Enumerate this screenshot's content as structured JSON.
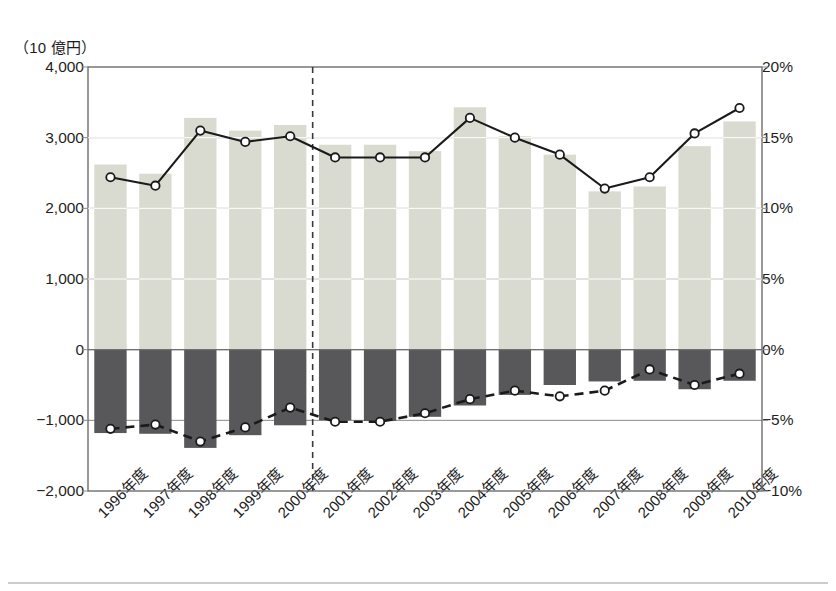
{
  "chart_data": {
    "type": "bar",
    "title": "",
    "subtitle": "",
    "unit_label": "（10 億円）",
    "xlabel": "",
    "ylabel": "",
    "grid": true,
    "legend_position": "none",
    "categories": [
      "1996年度",
      "1997年度",
      "1998年度",
      "1999年度",
      "2000年度",
      "2001年度",
      "2002年度",
      "2003年度",
      "2004年度",
      "2005年度",
      "2006年度",
      "2007年度",
      "2008年度",
      "2009年度",
      "2010年度"
    ],
    "left_axis": {
      "ticks": [
        "4,000",
        "3,000",
        "2,000",
        "1,000",
        "0",
        "-1,000",
        "-2,000"
      ],
      "tick_values": [
        4000,
        3000,
        2000,
        1000,
        0,
        -1000,
        -2000
      ],
      "ylim": [
        -2000,
        4000
      ],
      "unit": "（10 億円）"
    },
    "right_axis": {
      "ticks": [
        "20%",
        "15%",
        "10%",
        "5%",
        "0%",
        "-5%",
        "-10%"
      ],
      "tick_values": [
        20,
        15,
        10,
        5,
        0,
        -5,
        -10
      ],
      "ylim": [
        -10,
        20
      ]
    },
    "annotations": [
      {
        "name": "period-divider",
        "type": "vertical-dashed-line",
        "after_category": "2000年度"
      }
    ],
    "series": [
      {
        "name": "positive-bars",
        "type": "bar",
        "axis": "left",
        "color": "#d9dbd0",
        "values": [
          2620,
          2490,
          3280,
          3100,
          3180,
          2900,
          2900,
          2810,
          3430,
          3020,
          2760,
          2240,
          2310,
          2880,
          3230
        ]
      },
      {
        "name": "negative-bars",
        "type": "bar",
        "axis": "left",
        "color": "#58585a",
        "values": [
          -1180,
          -1190,
          -1390,
          -1210,
          -1070,
          -1000,
          -1010,
          -950,
          -790,
          -640,
          -500,
          -450,
          -440,
          -560,
          -440
        ]
      },
      {
        "name": "upper-ratio-line",
        "type": "line",
        "axis": "right",
        "style": "solid",
        "marker": "open-circle",
        "values": [
          12.2,
          11.6,
          15.5,
          14.7,
          15.1,
          13.6,
          13.6,
          13.6,
          16.4,
          15.0,
          13.8,
          11.4,
          12.2,
          15.3,
          17.1
        ]
      },
      {
        "name": "lower-ratio-line",
        "type": "line",
        "axis": "right",
        "style": "dashed",
        "marker": "open-circle",
        "values": [
          -5.6,
          -5.3,
          -6.5,
          -5.5,
          -4.1,
          -5.1,
          -5.1,
          -4.5,
          -3.5,
          -2.9,
          -3.3,
          -2.9,
          -1.4,
          -2.5,
          -1.7
        ]
      }
    ]
  },
  "colors": {
    "bar_positive": "#d9dbd0",
    "bar_negative": "#58585a",
    "line": "#1a1a1a",
    "grid": "#8a8a86",
    "frame": "#6e6e6e",
    "background": "#ffffff"
  }
}
